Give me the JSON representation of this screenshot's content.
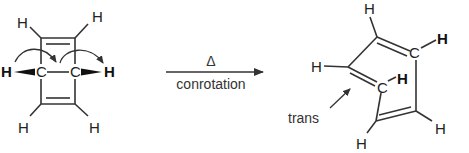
{
  "diagram": {
    "type": "reaction-scheme",
    "reactant": {
      "name": "bicyclo[2.2.0]hexa-2,5-diene",
      "atoms": {
        "h_top_left": "H",
        "h_top_right": "H",
        "h_left_bold": "H",
        "h_right_bold": "H",
        "c_left": "C",
        "c_right": "C",
        "h_bottom_left": "H",
        "h_bottom_right": "H"
      }
    },
    "reaction_arrow": {
      "above": "Δ",
      "below": "conrotation"
    },
    "product": {
      "atoms": {
        "h_top": "H",
        "c_top_right": "C",
        "h_top_right": "H",
        "h_left": "H",
        "c_middle": "C",
        "h_middle": "H",
        "h_bottom_left": "H",
        "h_bottom_right": "H"
      },
      "annotation": "trans"
    },
    "colors": {
      "ink": "#333333",
      "background": "#ffffff"
    }
  }
}
